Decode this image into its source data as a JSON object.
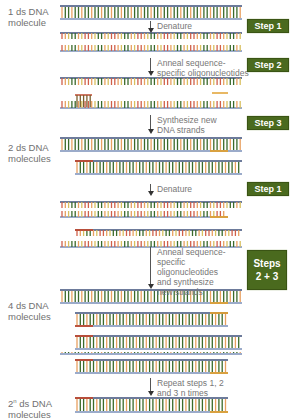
{
  "labels": {
    "mol1_line1": "1 ds DNA",
    "mol1_line2": "molecule",
    "mol2_line1": "2 ds DNA",
    "mol2_line2": "molecules",
    "mol4_line1": "4 ds DNA",
    "mol4_line2": "molecules",
    "moln_base": "2",
    "moln_exp": "n",
    "moln_rest": " ds DNA",
    "moln_line2": "molecules"
  },
  "arrows": {
    "denature1": "Denature",
    "anneal1_line1": "Anneal sequence-",
    "anneal1_line2": "specific oligonucleotides",
    "synth_line1": "Synthesize new",
    "synth_line2": "DNA strands",
    "denature2": "Denature",
    "anneal2_line1": "Anneal sequence-",
    "anneal2_line2": "specific",
    "anneal2_line3": "oligonucleotides",
    "anneal2_line4": "and synthesize",
    "anneal2_line5": "new strands",
    "repeat_line1": "Repeat steps 1, 2",
    "repeat_line2": "and 3 n times"
  },
  "steps": {
    "step1a": "Step 1",
    "step2": "Step 2",
    "step3": "Step 3",
    "step1b": "Step 1",
    "steps23_line1": "Steps",
    "steps23_line2": "2 + 3"
  },
  "colors": {
    "backbone_top": "#3d4f7a",
    "backbone_bottom": "#7a8fb8",
    "base_orange": "#e8a060",
    "base_red": "#d0604a",
    "base_green": "#3a6a2a",
    "base_yellow": "#d8c060",
    "primer_red": "#c04a30",
    "primer_orange": "#e0a030",
    "step_badge": "#4a6a1e"
  }
}
